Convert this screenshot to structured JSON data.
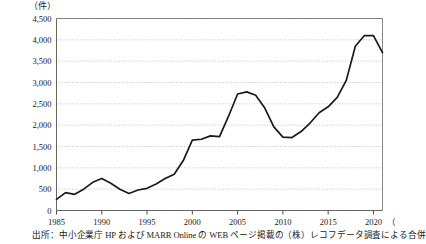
{
  "chart_data": {
    "type": "line",
    "title": "",
    "subtitle": "",
    "unit_label_y": "（件）",
    "unit_label_x": "（年）",
    "xlabel": "",
    "ylabel": "",
    "ylim": [
      0,
      4500
    ],
    "xlim": [
      1985,
      2021
    ],
    "grid": true,
    "legend_position": "none",
    "y_ticks": [
      "0",
      "500",
      "1,000",
      "1,500",
      "2,000",
      "2,500",
      "3,000",
      "3,500",
      "4,000",
      "4,500"
    ],
    "y_tick_values": [
      0,
      500,
      1000,
      1500,
      2000,
      2500,
      3000,
      3500,
      4000,
      4500
    ],
    "x_ticks": [
      "1985",
      "1990",
      "1995",
      "2000",
      "2005",
      "2010",
      "2015",
      "2020"
    ],
    "x_tick_values": [
      1985,
      1990,
      1995,
      2000,
      2005,
      2010,
      2015,
      2020
    ],
    "series": [
      {
        "name": "M&A件数",
        "color": "#1a1a1a",
        "x": [
          1985,
          1986,
          1987,
          1988,
          1989,
          1990,
          1991,
          1992,
          1993,
          1994,
          1995,
          1996,
          1997,
          1998,
          1999,
          2000,
          2001,
          2002,
          2003,
          2004,
          2005,
          2006,
          2007,
          2008,
          2009,
          2010,
          2011,
          2012,
          2013,
          2014,
          2015,
          2016,
          2017,
          2018,
          2019,
          2020,
          2021
        ],
        "values": [
          260,
          420,
          380,
          500,
          660,
          750,
          640,
          500,
          400,
          480,
          520,
          620,
          750,
          850,
          1170,
          1650,
          1670,
          1750,
          1730,
          2210,
          2730,
          2780,
          2700,
          2400,
          1960,
          1720,
          1710,
          1850,
          2050,
          2290,
          2430,
          2650,
          3050,
          3850,
          4100,
          4100,
          3700
        ]
      }
    ],
    "source_note": "出所：中小企業庁 HP および MARR Online の WEB ページ掲載の（株）レコフデータ調査による合併"
  }
}
